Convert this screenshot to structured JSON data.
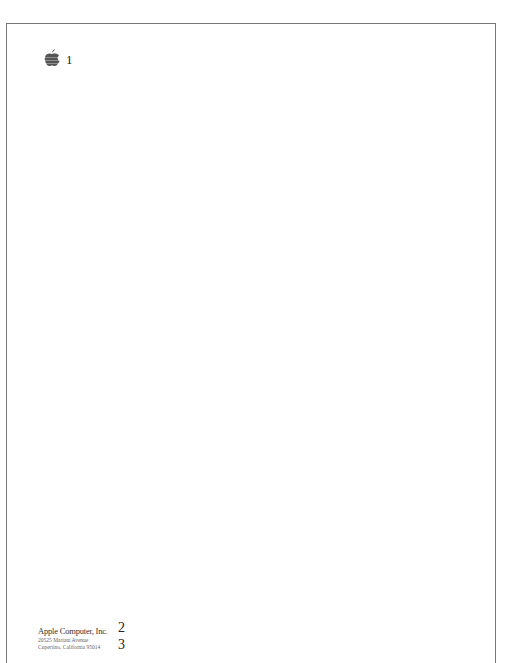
{
  "letterhead": {
    "logo_icon": "apple-logo-icon",
    "markers": [
      "1",
      "2",
      "3"
    ],
    "company": "Apple Computer, Inc.",
    "street": "20525 Mariani Avenue",
    "city": "Cupertino, California 95014"
  }
}
